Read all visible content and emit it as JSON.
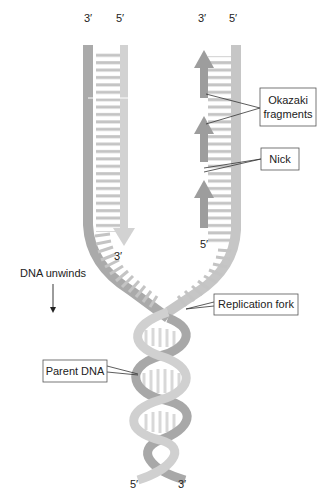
{
  "diagram": {
    "colors": {
      "dark_strand": "#a9a9a9",
      "light_strand": "#cfcfcf",
      "rung": "#bdbdbd",
      "okazaki": "#9a9a9a",
      "text": "#222222",
      "box_border": "#555555"
    },
    "strand_ends": {
      "left_top_3": "3′",
      "left_top_5": "5′",
      "right_top_3": "3′",
      "right_top_5": "5′",
      "leading_tip_3": "3′",
      "lagging_start_5": "5′",
      "bottom_5": "5′",
      "bottom_3": "3′"
    },
    "labels": {
      "okazaki_line1": "Okazaki",
      "okazaki_line2": "fragments",
      "nick": "Nick",
      "dna_unwinds": "DNA unwinds",
      "replication_fork": "Replication fork",
      "parent_dna": "Parent DNA"
    }
  }
}
